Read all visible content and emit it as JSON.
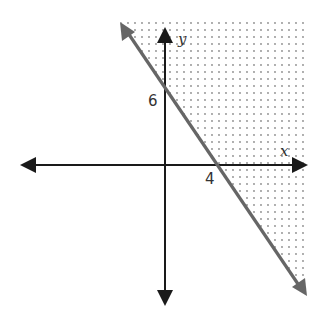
{
  "graph": {
    "description": "Graph of a linear inequality with shaded half-plane",
    "x_axis_label": "x",
    "y_axis_label": "y",
    "x_intercept_label": "4",
    "y_intercept_label": "6",
    "boundary_line": {
      "x_intercept": 4,
      "y_intercept": 6,
      "style": "solid"
    },
    "shaded_region": "above-right of boundary line (dotted)",
    "colors": {
      "axes": "#1a1a1a",
      "boundary_line": "#666666",
      "shade_dots": "#888888"
    }
  }
}
